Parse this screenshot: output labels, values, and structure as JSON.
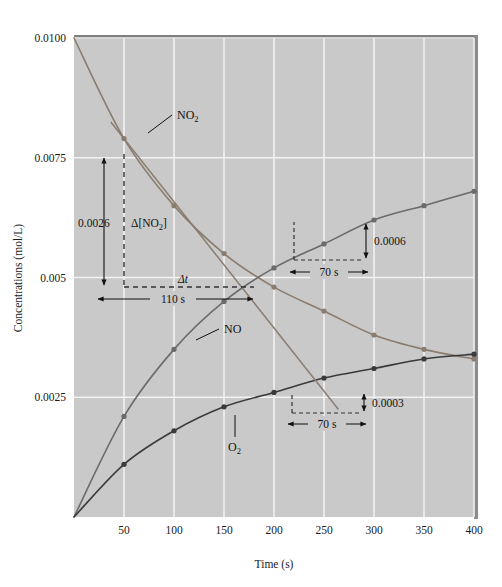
{
  "chart_data": {
    "type": "line",
    "title": "",
    "xlabel": "Time (s)",
    "ylabel": "Concentrations (mol/L)",
    "xlim": [
      0,
      400
    ],
    "ylim": [
      0,
      0.01
    ],
    "grid": true,
    "legend_position": "inline-labels",
    "x_ticks": [
      "50",
      "100",
      "150",
      "200",
      "250",
      "300",
      "350",
      "400"
    ],
    "x_tick_values": [
      50,
      100,
      150,
      200,
      250,
      300,
      350,
      400
    ],
    "y_ticks": [
      "0.0100",
      "0.0075",
      "0.005",
      "0.0025"
    ],
    "y_tick_values": [
      0.01,
      0.0075,
      0.005,
      0.0025
    ],
    "x": [
      0,
      50,
      100,
      150,
      200,
      250,
      300,
      350,
      400
    ],
    "series": [
      {
        "name": "NO2",
        "label": "NO₂",
        "color": "#8a7d70",
        "values": [
          0.01,
          0.0079,
          0.0065,
          0.0055,
          0.0048,
          0.0043,
          0.0038,
          0.0035,
          0.0033
        ]
      },
      {
        "name": "NO",
        "label": "NO",
        "color": "#6b6b6b",
        "values": [
          0.0,
          0.0021,
          0.0035,
          0.0045,
          0.0052,
          0.0057,
          0.0062,
          0.0065,
          0.0068
        ]
      },
      {
        "name": "O2",
        "label": "O₂",
        "color": "#3a3a3a",
        "values": [
          0.0,
          0.0011,
          0.0018,
          0.0023,
          0.0026,
          0.0029,
          0.0031,
          0.0033,
          0.0034
        ]
      }
    ],
    "annotations": [
      {
        "id": "delta-no2",
        "value_label": "0.0026",
        "symbol_label": "Δ[NO₂]",
        "time_symbol_label": "Δt",
        "time_value_label": "110 s",
        "attached_to": "NO2",
        "t_start": 50,
        "t_end": 160,
        "c_start": 0.0079,
        "c_end": 0.005
      },
      {
        "id": "rate-no",
        "value_label": "0.0006",
        "time_value_label": "70 s",
        "attached_to": "NO",
        "t_start": 220,
        "t_end": 290,
        "c_start": 0.00545,
        "c_end": 0.00605
      },
      {
        "id": "rate-o2",
        "value_label": "0.0003",
        "time_value_label": "70 s",
        "attached_to": "O2",
        "t_start": 225,
        "t_end": 295,
        "c_start": 0.00277,
        "c_end": 0.00307
      }
    ],
    "colors": {
      "plot_background": "#c9c9c9",
      "gridline": "#f2f2f2",
      "page_background": "#ffffff",
      "axis_text": "#1a1a1a",
      "frame_shadow": "#7a7a7a"
    }
  }
}
